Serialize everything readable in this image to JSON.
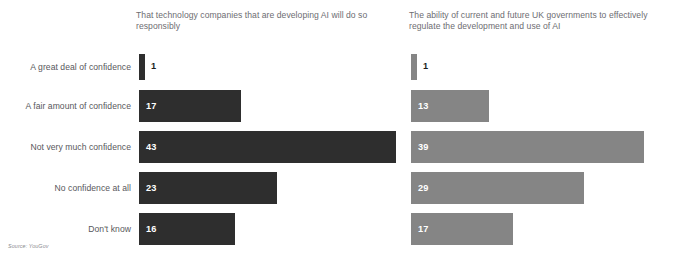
{
  "cropped_title_remnant": "",
  "source": "Source: YouGov",
  "panels": [
    {
      "id": "tech-companies",
      "heading": "That technology companies that are developing AI will do so responsibly",
      "color": "#2e2e2e"
    },
    {
      "id": "uk-governments",
      "heading": "The ability of current and future UK governments to effectively regulate the development and use of AI",
      "color": "#858585"
    }
  ],
  "rows": [
    {
      "label": "A great deal of confidence",
      "left": "1",
      "right": "1"
    },
    {
      "label": "A fair amount of confidence",
      "left": "17",
      "right": "13"
    },
    {
      "label": "Not very much confidence",
      "left": "43",
      "right": "39"
    },
    {
      "label": "No confidence at all",
      "left": "23",
      "right": "29"
    },
    {
      "label": "Don't know",
      "left": "16",
      "right": "17"
    }
  ],
  "chart_data": {
    "type": "bar",
    "orientation": "horizontal",
    "title": "",
    "subtitle": "",
    "xlabel": "",
    "ylabel": "",
    "xlim": [
      0,
      43
    ],
    "grid": false,
    "legend_position": "panel-headings",
    "categories": [
      "A great deal of confidence",
      "A fair amount of confidence",
      "Not very much confidence",
      "No confidence at all",
      "Don't know"
    ],
    "series": [
      {
        "name": "That technology companies that are developing AI will do so responsibly",
        "color": "#2e2e2e",
        "values": [
          1,
          17,
          43,
          23,
          16
        ]
      },
      {
        "name": "The ability of current and future UK governments to effectively regulate the development and use of AI",
        "color": "#858585",
        "values": [
          1,
          13,
          39,
          29,
          17
        ]
      }
    ],
    "value_labels": true,
    "units": "percent",
    "source": "Source: YouGov"
  }
}
